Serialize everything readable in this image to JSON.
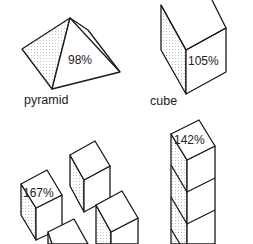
{
  "figure": {
    "shapes": [
      {
        "id": "pyramid",
        "label": "pyramid",
        "percent": "98%"
      },
      {
        "id": "cube",
        "label": "cube",
        "percent": "105%"
      },
      {
        "id": "scattered-cubes",
        "label": "",
        "percent": "167%"
      },
      {
        "id": "stacked-cubes",
        "label": "",
        "percent": "142%"
      }
    ]
  },
  "colors": {
    "line": "#1a1a1a",
    "background": "#ffffff"
  }
}
